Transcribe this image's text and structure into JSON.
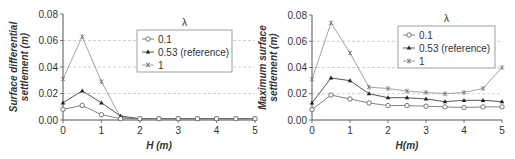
{
  "chart_data": [
    {
      "type": "line",
      "title": "",
      "xlabel": "H (m)",
      "ylabel": "Surface differential settlement (m)",
      "x": [
        0,
        0.5,
        1,
        1.5,
        2,
        2.5,
        3,
        3.5,
        4,
        4.5,
        5
      ],
      "xticks": [
        "0",
        "1",
        "2",
        "3",
        "4",
        "5"
      ],
      "yticks": [
        "0.00",
        "0.02",
        "0.04",
        "0.06",
        "0.08"
      ],
      "ylim": [
        0,
        0.08
      ],
      "xlim": [
        0,
        5
      ],
      "grid": "horizontal dashed",
      "legend_title": "λ",
      "legend_position": "upper right",
      "series": [
        {
          "name": "0.1",
          "marker": "open-circle",
          "values": [
            0.008,
            0.011,
            0.004,
            0.001,
            0.001,
            0.001,
            0.001,
            0.001,
            0.001,
            0.001,
            0.001
          ]
        },
        {
          "name": "0.53 (reference)",
          "marker": "filled-triangle",
          "values": [
            0.013,
            0.022,
            0.013,
            0.003,
            0.001,
            0.001,
            0.001,
            0.001,
            0.001,
            0.001,
            0.001
          ]
        },
        {
          "name": "1",
          "marker": "star",
          "values": [
            0.031,
            0.063,
            0.029,
            0.002,
            0.001,
            0.001,
            0.001,
            0.001,
            0.001,
            0.001,
            0.001
          ]
        }
      ]
    },
    {
      "type": "line",
      "title": "",
      "xlabel": "H(m)",
      "ylabel": "Maximum surface settlement (m)",
      "x": [
        0,
        0.5,
        1,
        1.5,
        2,
        2.5,
        3,
        3.5,
        4,
        4.5,
        5
      ],
      "xticks": [
        "0",
        "1",
        "2",
        "3",
        "4",
        "5"
      ],
      "yticks": [
        "0.00",
        "0.02",
        "0.04",
        "0.06",
        "0.08"
      ],
      "ylim": [
        0,
        0.08
      ],
      "xlim": [
        0,
        5
      ],
      "grid": "horizontal dashed",
      "legend_title": "λ",
      "legend_position": "upper right",
      "series": [
        {
          "name": "0.1",
          "marker": "open-circle",
          "values": [
            0.008,
            0.019,
            0.016,
            0.013,
            0.011,
            0.011,
            0.0105,
            0.01,
            0.0095,
            0.01,
            0.01
          ]
        },
        {
          "name": "0.53 (reference)",
          "marker": "filled-triangle",
          "values": [
            0.013,
            0.032,
            0.03,
            0.02,
            0.017,
            0.017,
            0.016,
            0.014,
            0.015,
            0.015,
            0.014
          ]
        },
        {
          "name": "1",
          "marker": "star",
          "values": [
            0.031,
            0.074,
            0.051,
            0.025,
            0.024,
            0.022,
            0.021,
            0.02,
            0.021,
            0.024,
            0.04
          ]
        }
      ]
    }
  ],
  "left": {
    "ylabel_line1": "Surface differential",
    "ylabel_line2": "settlement (m)",
    "xlabel": "H (m)"
  },
  "right": {
    "ylabel_line1": "Maximum surface",
    "ylabel_line2": "settlement (m)",
    "xlabel": "H(m)"
  },
  "legend": {
    "title": "λ",
    "items": [
      "0.1",
      "0.53 (reference)",
      "1"
    ]
  }
}
